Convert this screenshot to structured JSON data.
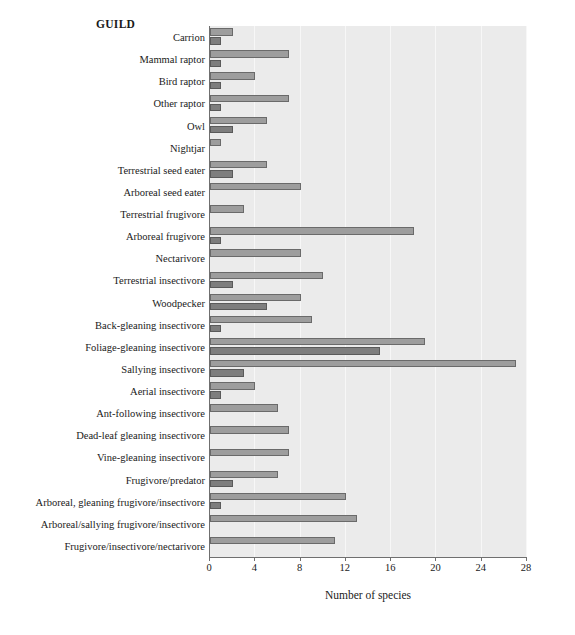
{
  "chart_data": {
    "type": "bar",
    "orientation": "horizontal",
    "title": "",
    "legend_title": "GUILD",
    "xlabel": "Number of species",
    "ylabel": "",
    "xlim": [
      0,
      28
    ],
    "xticks": [
      0,
      4,
      8,
      12,
      16,
      20,
      24,
      28
    ],
    "grid": true,
    "grid_axis": "x",
    "legend_position": "none",
    "categories": [
      "Carrion",
      "Mammal raptor",
      "Bird raptor",
      "Other raptor",
      "Owl",
      "Nightjar",
      "Terrestrial seed eater",
      "Arboreal seed eater",
      "Terrestrial frugivore",
      "Arboreal frugivore",
      "Nectarivore",
      "Terrestrial insectivore",
      "Woodpecker",
      "Back-gleaning insectivore",
      "Foliage-gleaning insectivore",
      "Sallying insectivore",
      "Aerial insectivore",
      "Ant-following insectivore",
      "Dead-leaf gleaning insectivore",
      "Vine-gleaning insectivore",
      "Frugivore/predator",
      "Arboreal, gleaning frugivore/insectivore",
      "Arboreal/sallying frugivore/insectivore",
      "Frugivore/insectivore/nectarivore"
    ],
    "series": [
      {
        "name": "upper",
        "color": "#9d9d9d",
        "values": [
          2,
          7,
          4,
          7,
          5,
          1,
          5,
          8,
          3,
          18,
          8,
          10,
          8,
          9,
          19,
          27,
          4,
          6,
          7,
          7,
          6,
          12,
          13,
          11
        ]
      },
      {
        "name": "lower",
        "color": "#7e7e7e",
        "values": [
          1,
          1,
          1,
          1,
          2,
          0,
          2,
          0,
          0,
          1,
          0,
          2,
          5,
          1,
          15,
          3,
          1,
          0,
          0,
          0,
          2,
          1,
          0,
          0
        ]
      }
    ]
  },
  "colors": {
    "plot_background": "#ebebeb",
    "gridline": "#f7f7f7",
    "axis": "#6f6f6f",
    "bar_upper": "#9d9d9d",
    "bar_lower": "#7e7e7e",
    "page_background": "#ffffff"
  }
}
